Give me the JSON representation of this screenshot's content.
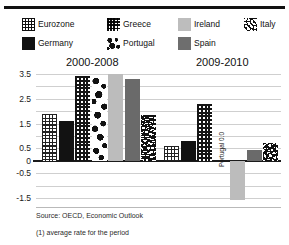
{
  "legend": {
    "row1": [
      {
        "label": "Eurozone",
        "pattern": "grid",
        "color": "#111111",
        "x": 0
      },
      {
        "label": "Greece",
        "pattern": "dots",
        "color": "#111111",
        "x": 85
      },
      {
        "label": "Ireland",
        "pattern": "solid",
        "color": "#bdbdbd",
        "x": 156
      },
      {
        "label": "Italy",
        "pattern": "wave",
        "color": "#111111",
        "x": 222
      }
    ],
    "row2": [
      {
        "label": "Germany",
        "pattern": "solid",
        "color": "#111111",
        "x": 0
      },
      {
        "label": "Portugal",
        "pattern": "blob",
        "color": "#111111",
        "x": 85
      },
      {
        "label": "Spain",
        "pattern": "solid",
        "color": "#6e6e6e",
        "x": 156
      }
    ]
  },
  "chart_data": {
    "type": "bar",
    "title": "",
    "subtitle": "",
    "xlabel": "",
    "ylabel": "",
    "ylim": [
      -1.5,
      3.5
    ],
    "yticks": [
      3.5,
      3.0,
      2.5,
      2.0,
      1.5,
      1.0,
      0.5,
      0.0,
      -0.5,
      -1.0,
      -1.5
    ],
    "ytick_labels": [
      "3.5",
      "",
      "2.5",
      "",
      "1.5",
      "",
      "0.5",
      "0",
      "-0.5",
      "",
      "-1.5"
    ],
    "grid": true,
    "legend_position": "top",
    "categories": [
      "2000-2008",
      "2009-2010"
    ],
    "series": [
      {
        "name": "Eurozone",
        "pattern": "grid",
        "color": "#111111",
        "values": [
          1.9,
          0.6
        ]
      },
      {
        "name": "Germany",
        "pattern": "solid",
        "color": "#121212",
        "values": [
          1.6,
          0.78
        ]
      },
      {
        "name": "Greece",
        "pattern": "dots",
        "color": "#151515",
        "values": [
          3.4,
          2.3
        ]
      },
      {
        "name": "Portugal",
        "pattern": "blob",
        "color": "#111111",
        "values": [
          3.4,
          0.0
        ]
      },
      {
        "name": "Ireland",
        "pattern": "solid",
        "color": "#bcbcbc",
        "values": [
          3.5,
          -1.6
        ]
      },
      {
        "name": "Spain",
        "pattern": "solid",
        "color": "#6a6a6a",
        "values": [
          3.3,
          0.45
        ]
      },
      {
        "name": "Italy",
        "pattern": "wave",
        "color": "#111111",
        "values": [
          1.85,
          0.7
        ]
      }
    ],
    "annotations": [
      {
        "text": "Portugal 0.0",
        "series": "Portugal",
        "group": "2009-2010",
        "rotation": -90
      }
    ]
  },
  "groups": {
    "g1_title": "2000-2008",
    "g2_title": "2009-2010"
  },
  "footer": {
    "source": "Source: OECD, Economic Outlook",
    "footnote": "(1) average rate for the period"
  }
}
